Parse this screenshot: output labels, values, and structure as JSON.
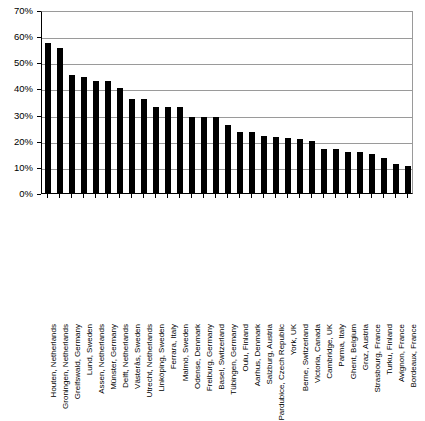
{
  "chart_data": {
    "type": "bar",
    "title": "",
    "subtitle": "",
    "xlabel": "",
    "ylabel": "",
    "ylim": [
      0,
      70
    ],
    "ytick_labels": [
      "0%",
      "10%",
      "20%",
      "30%",
      "40%",
      "50%",
      "60%",
      "70%"
    ],
    "ytick_values": [
      0,
      10,
      20,
      30,
      40,
      50,
      60,
      70
    ],
    "grid": true,
    "legend": false,
    "legend_position": "none",
    "bar_color": "#000000",
    "axis_color": "#000000",
    "grid_color": "#9a9a9a",
    "categories": [
      "Houten, Netherlands",
      "Groningen, Netherlands",
      "Greifswald, Germany",
      "Lund, Sweden",
      "Assen, Netherlands",
      "Münster, Germany",
      "Delft, Netherlands",
      "Västerås, Sweden",
      "Utrecht, Netherlands",
      "Linköping, Sweden",
      "Ferrara, Italy",
      "Malmö, Sweden",
      "Odense, Denmark",
      "Freiburg, Germany",
      "Basel, Switzerland",
      "Tübingen, Germany",
      "Oulu, Finland",
      "Aarhus, Denmark",
      "Salzburg, Austria",
      "Pardubice, Czech Republic",
      "York, UK",
      "Berne, Switzerland",
      "Victoria, Canada",
      "Cambridge, UK",
      "Parma, Italy",
      "Ghent, Belgium",
      "Graz, Austria",
      "Strasbourg, France",
      "Turku, Finland",
      "Avignon, France",
      "Bordeaux, France"
    ],
    "values": [
      57.5,
      55.5,
      45,
      44.5,
      43,
      43,
      40,
      36,
      36,
      33,
      33,
      33,
      29,
      29,
      29,
      26,
      23.5,
      23.5,
      22,
      21.5,
      21,
      20.5,
      20,
      17,
      17,
      15.5,
      15.5,
      15,
      13.5,
      11,
      10.5
    ],
    "value_labels": [
      "57.5%",
      "55.5%",
      "45%",
      "44.5%",
      "43%",
      "43%",
      "40%",
      "36%",
      "36%",
      "33%",
      "33%",
      "33%",
      "29%",
      "29%",
      "29%",
      "26%",
      "23.5%",
      "23.5%",
      "22%",
      "21.5%",
      "21%",
      "20.5%",
      "20%",
      "17%",
      "17%",
      "15.5%",
      "15.5%",
      "15%",
      "13.5%",
      "11%",
      "10.5%"
    ]
  }
}
